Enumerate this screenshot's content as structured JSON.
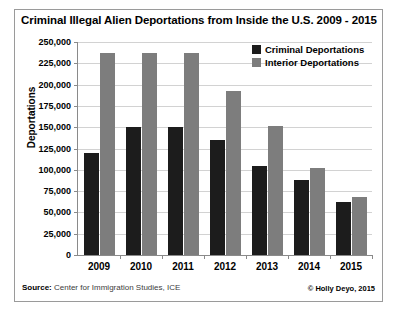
{
  "chart_data": {
    "type": "bar",
    "title": "Criminal Illegal Alien Deportations from Inside the U.S. 2009 - 2015",
    "xlabel": "",
    "ylabel": "Deportations",
    "categories": [
      "2009",
      "2010",
      "2011",
      "2012",
      "2013",
      "2014",
      "2015"
    ],
    "series": [
      {
        "name": "Criminal Deportations",
        "color": "#1c1c1c",
        "values": [
          120000,
          150000,
          150000,
          135000,
          105000,
          88000,
          62000
        ]
      },
      {
        "name": "Interior Deportations",
        "color": "#7d7d7d",
        "values": [
          237000,
          237000,
          237000,
          193000,
          151000,
          102000,
          68000
        ]
      }
    ],
    "ylim": [
      0,
      250000
    ],
    "ytick_values": [
      0,
      25000,
      50000,
      75000,
      100000,
      125000,
      150000,
      175000,
      200000,
      225000,
      250000
    ],
    "ytick_labels": [
      "0",
      "25,000",
      "50,000",
      "75,000",
      "100,000",
      "125,000",
      "150,000",
      "175,000",
      "200,000",
      "225,000",
      "250,000"
    ],
    "grid": true,
    "legend_position": "top-right"
  },
  "footer": {
    "source_label": "Source:",
    "source_text": " Center for Immigration Studies, ICE",
    "credit": "© Holly Deyo, 2015"
  }
}
